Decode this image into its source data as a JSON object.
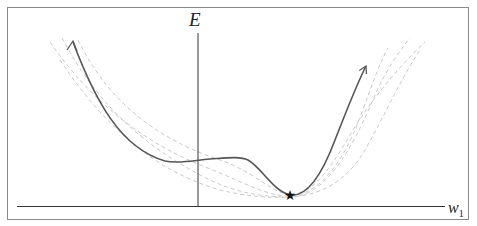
{
  "diagram": {
    "type": "error-surface-illustration",
    "y_axis_label": "E",
    "x_axis_label_base": "w",
    "x_axis_label_subscript": "1",
    "main_curve": {
      "style": "solid",
      "color": "#555555",
      "arrow_ends": [
        "left-top",
        "right-top"
      ],
      "description": "non-convex curve with a flat plateau crossing the E axis and a global minimum to the right"
    },
    "minimum_marker": {
      "symbol": "★",
      "color": "#111111"
    },
    "dashed_curves": {
      "count": 4,
      "color": "#c8c8c8",
      "style": "dashed"
    },
    "colors": {
      "axis": "#333333",
      "border": "#888888",
      "background": "#ffffff"
    }
  }
}
